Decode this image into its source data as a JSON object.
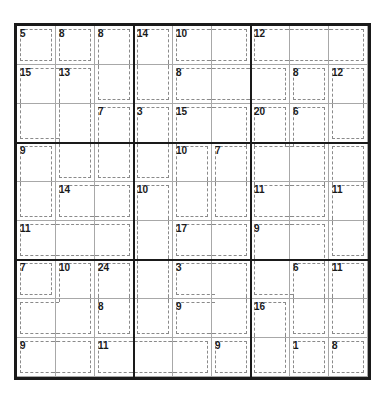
{
  "puzzle": {
    "type": "killer-sudoku",
    "size": 9,
    "colors": {
      "box_line": "#1a1a1a",
      "cell_line": "#a8a8a8",
      "cage_line": "#8a8a8a",
      "text": "#1a1a1a"
    },
    "cells": [
      [
        "5",
        "8",
        "8",
        "14",
        "10",
        "",
        "12",
        "",
        ""
      ],
      [
        "15",
        "13",
        "",
        "",
        "8",
        "",
        "",
        "8",
        "12"
      ],
      [
        "",
        "",
        "7",
        "3",
        "15",
        "",
        "20",
        "6",
        ""
      ],
      [
        "9",
        "",
        "",
        "",
        "10",
        "7",
        "",
        "",
        ""
      ],
      [
        "",
        "14",
        "",
        "10",
        "",
        "",
        "11",
        "",
        "11"
      ],
      [
        "11",
        "",
        "",
        "",
        "17",
        "",
        "9",
        "",
        ""
      ],
      [
        "7",
        "10",
        "24",
        "",
        "3",
        "",
        "",
        "6",
        "11"
      ],
      [
        "",
        "",
        "8",
        "",
        "9",
        "",
        "16",
        "",
        ""
      ],
      [
        "9",
        "",
        "11",
        "",
        "",
        "9",
        "",
        "1",
        "8"
      ]
    ],
    "cage_borders": [
      [
        "tlbr",
        "tlbr",
        "tlr",
        "tlr",
        "tlb",
        "trb",
        "tlb",
        "tb",
        "trb"
      ],
      [
        "tl",
        "tlr",
        "lbr",
        "lbr",
        "tlb",
        "tb",
        "trb",
        "tlbr",
        "tlr"
      ],
      [
        "lb",
        "lr",
        "tlr",
        "tlr",
        "tl",
        "tr",
        "tlr",
        "tlr",
        "lbr"
      ],
      [
        "tlr",
        "lbr",
        "lbr",
        "lbr",
        "tlr",
        "tlr",
        "tl",
        "tr",
        "tlr"
      ],
      [
        "lbr",
        "tlb",
        "tbr",
        "tlr",
        "lbr",
        "lbr",
        "tlb",
        "trb",
        "tlr"
      ],
      [
        "tlb",
        "tb",
        "trb",
        "lr",
        "tlb",
        "trb",
        "tl",
        "tr",
        "lbr"
      ],
      [
        "tlbr",
        "tlr",
        "tlr",
        "lr",
        "tlb",
        "tr",
        "lb",
        "tlr",
        "tlr"
      ],
      [
        "tlb",
        "rb",
        "lbr",
        "lbr",
        "tlb",
        "rb",
        "tlr",
        "lbr",
        "lbr"
      ],
      [
        "tlb",
        "trb",
        "tlb",
        "tb",
        "trb",
        "tlbr",
        "lbr",
        "tlbr",
        "tlbr"
      ]
    ]
  }
}
